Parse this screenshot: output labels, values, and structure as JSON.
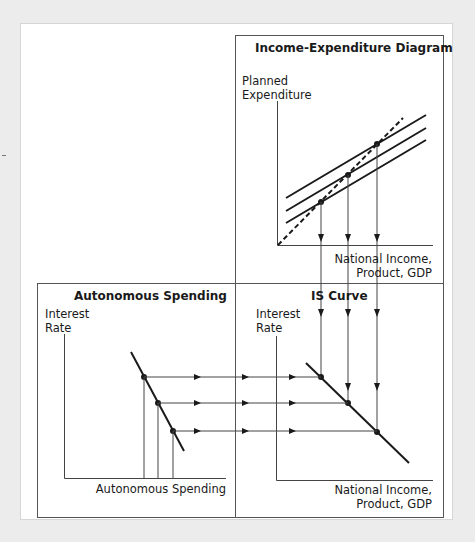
{
  "panels": {
    "income_expenditure": {
      "title": "Income-Expenditure Diagram",
      "y_axis_label_line1": "Planned",
      "y_axis_label_line2": "Expenditure",
      "x_axis_label_line1": "National Income,",
      "x_axis_label_line2": "Product, GDP"
    },
    "autonomous_spending": {
      "title": "Autonomous Spending",
      "y_axis_label_line1": "Interest",
      "y_axis_label_line2": "Rate",
      "x_axis_label": "Autonomous Spending"
    },
    "is_curve": {
      "title": "IS Curve",
      "y_axis_label_line1": "Interest",
      "y_axis_label_line2": "Rate",
      "x_axis_label_line1": "National Income,",
      "x_axis_label_line2": "Product, GDP"
    }
  },
  "colors": {
    "page_background": "#ececec",
    "card_background": "#ffffff",
    "line": "#1a1a1a",
    "box_border": "#555555",
    "guide_line": "#444444"
  }
}
